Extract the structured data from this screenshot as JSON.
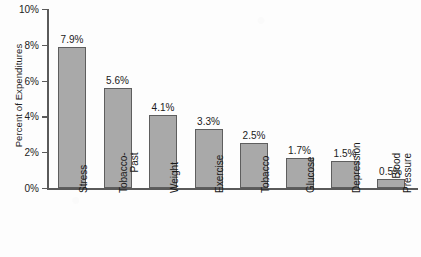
{
  "chart_data": {
    "type": "bar",
    "title": "",
    "xlabel": "",
    "ylabel": "Percent of Expenditures",
    "ylim": [
      0,
      10
    ],
    "grid": false,
    "legend": "none",
    "y_tick_labels": [
      "10%",
      "8%",
      "6%",
      "4%",
      "2%",
      "0%"
    ],
    "y_tick_values": [
      10,
      8,
      6,
      4,
      2,
      0
    ],
    "categories": [
      "Stress",
      "Tobacco-Past",
      "Weight",
      "Exercise",
      "Tobacco",
      "Glucose",
      "Depression",
      "Blood Pressure"
    ],
    "category_lines": [
      [
        "Stress"
      ],
      [
        "Tobacco-",
        "Past"
      ],
      [
        "Weight"
      ],
      [
        "Exercise"
      ],
      [
        "Tobacco"
      ],
      [
        "Glucose"
      ],
      [
        "Depression"
      ],
      [
        "Blood",
        "Pressure"
      ]
    ],
    "values": [
      7.9,
      5.6,
      4.1,
      3.3,
      2.5,
      1.7,
      1.5,
      0.5
    ],
    "value_labels": [
      "7.9%",
      "5.6%",
      "4.1%",
      "3.3%",
      "2.5%",
      "1.7%",
      "1.5%",
      "0.5%"
    ],
    "bar_fill_color": "#a9a9a9",
    "bar_edge_color": "#5e5e5e",
    "axis_color": "#5a5a5a",
    "background_color": "#fdfdfd"
  }
}
